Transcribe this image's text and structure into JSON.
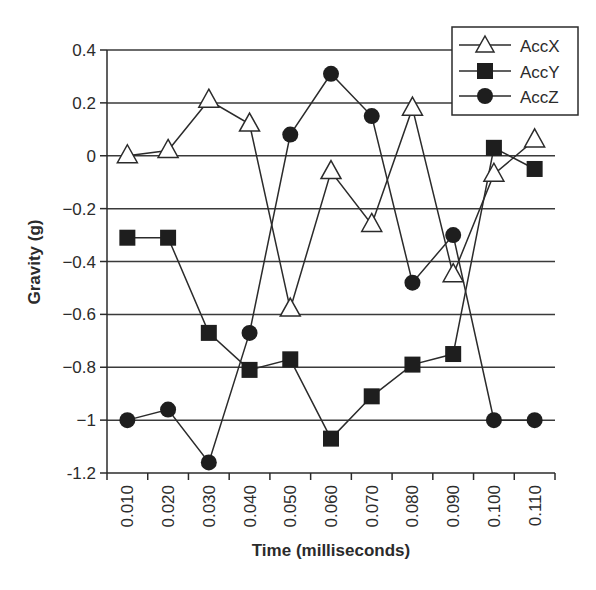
{
  "chart_data": {
    "type": "line",
    "title": "",
    "xlabel": "Time (milliseconds)",
    "ylabel": "Gravity (g)",
    "categories": [
      "0.010",
      "0.020",
      "0.030",
      "0.040",
      "0.050",
      "0.060",
      "0.070",
      "0.080",
      "0.090",
      "0.100",
      "0.110"
    ],
    "ylim": [
      -1.2,
      0.4
    ],
    "yticks": [
      0.4,
      0.2,
      0,
      -0.2,
      -0.4,
      -0.6,
      -0.8,
      -1,
      -1.2
    ],
    "ytick_labels": [
      "0.4",
      "0.2",
      "0",
      "−0.2",
      "−0.4",
      "−0.6",
      "−0.8",
      "−1",
      "-1.2"
    ],
    "grid": "horizontal",
    "legend_position": "top-right",
    "series": [
      {
        "name": "AccX",
        "marker": "open-triangle",
        "values": [
          0.0,
          0.02,
          0.21,
          0.12,
          -0.58,
          -0.06,
          -0.26,
          0.18,
          -0.45,
          -0.07,
          0.06
        ]
      },
      {
        "name": "AccY",
        "marker": "filled-square",
        "values": [
          -0.31,
          -0.31,
          -0.67,
          -0.81,
          -0.77,
          -1.07,
          -0.91,
          -0.79,
          -0.75,
          0.03,
          -0.05
        ]
      },
      {
        "name": "AccZ",
        "marker": "filled-circle",
        "values": [
          -1.0,
          -0.96,
          -1.16,
          -0.67,
          0.08,
          0.31,
          0.15,
          -0.48,
          -0.3,
          -1.0,
          -1.0
        ]
      }
    ]
  },
  "colors": {
    "line": "#2b2b2b",
    "grid": "#3a3a3a",
    "marker_fill": "#1e1e1e",
    "background": "#ffffff"
  }
}
